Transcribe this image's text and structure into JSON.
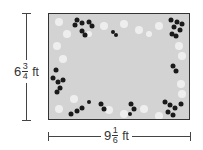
{
  "diagram": {
    "type": "rectangular rug with dimension labels",
    "height_label": {
      "whole": "6",
      "numerator": "3",
      "denominator": "4",
      "unit": "ft"
    },
    "width_label": {
      "whole": "9",
      "numerator": "1",
      "denominator": "6",
      "unit": "ft"
    },
    "colors": {
      "rug_fill": "#d3d3d3",
      "border": "#333333",
      "dark_flowers": "#1a1a1a",
      "light_flowers": "#f0f0f0"
    }
  }
}
